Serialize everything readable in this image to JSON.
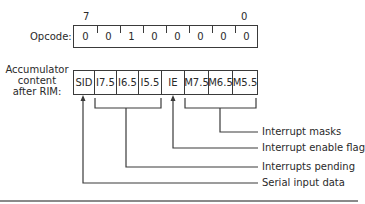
{
  "diagram": {
    "opcode": {
      "label": "Opcode:",
      "msb_label": "7",
      "lsb_label": "0",
      "bits": [
        "0",
        "0",
        "1",
        "0",
        "0",
        "0",
        "0",
        "0"
      ]
    },
    "accumulator": {
      "label_lines": [
        "Accumulator",
        "content",
        "after RIM:"
      ],
      "fields": [
        "SID",
        "I7.5",
        "I6.5",
        "I5.5",
        "IE",
        "M7.5",
        "M6.5",
        "M5.5"
      ]
    },
    "annotations": [
      {
        "text": "Interrupt masks",
        "targets": [
          "M7.5",
          "M6.5",
          "M5.5"
        ]
      },
      {
        "text": "Interrupt enable flag",
        "targets": [
          "IE"
        ]
      },
      {
        "text": "Interrupts pending",
        "targets": [
          "I7.5",
          "I6.5",
          "I5.5"
        ]
      },
      {
        "text": "Serial input data",
        "targets": [
          "SID"
        ]
      }
    ],
    "colors": {
      "line": "#3a3a3a",
      "text": "#2a2a2a",
      "rule": "#8a8a8a"
    }
  }
}
